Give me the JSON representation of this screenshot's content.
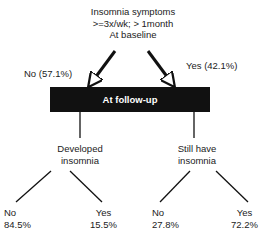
{
  "root": {
    "lines": [
      "Insomnia symptoms",
      ">=3x/wk; > 1month",
      "At baseline"
    ]
  },
  "branches": {
    "no_label": "No (57.1%)",
    "yes_label": "Yes (42.1%)"
  },
  "followup": {
    "label": "At follow-up"
  },
  "left": {
    "title_lines": [
      "Developed",
      "insomnia"
    ],
    "no": {
      "label": "No",
      "value": "84.5%"
    },
    "yes": {
      "label": "Yes",
      "value": "15.5%"
    }
  },
  "right": {
    "title_lines": [
      "Still have",
      "insomnia"
    ],
    "no": {
      "label": "No",
      "value": "27.8%"
    },
    "yes": {
      "label": "Yes",
      "value": "72.2%"
    }
  }
}
